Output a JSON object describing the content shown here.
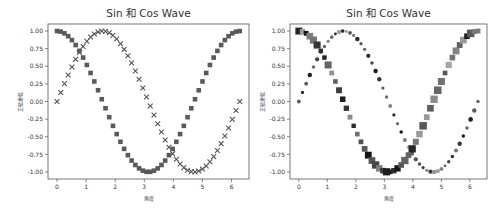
{
  "chart_data": [
    {
      "type": "scatter",
      "title": "Sin 和 Cos Wave",
      "xlabel": "角度",
      "ylabel": "正弦余弦",
      "xlim": [
        -0.31,
        6.6
      ],
      "ylim": [
        -1.1,
        1.1
      ],
      "xticks": [
        0,
        1,
        2,
        3,
        4,
        5,
        6
      ],
      "yticks": [
        -1.0,
        -0.75,
        -0.5,
        -0.25,
        0.0,
        0.25,
        0.5,
        0.75,
        1.0
      ],
      "ytick_labels": [
        "-1.00",
        "-0.75",
        "-0.50",
        "-0.25",
        "0.00",
        "0.25",
        "0.50",
        "0.75",
        "1.00"
      ],
      "grid": false,
      "legend": null,
      "x_range": [
        0,
        6.283
      ],
      "n_points": 50,
      "series": [
        {
          "name": "sin",
          "function": "sin(x)",
          "marker": "x",
          "color": "#555555",
          "size": "uniform"
        },
        {
          "name": "cos",
          "function": "cos(x)",
          "marker": "s",
          "color": "#555555",
          "size": "uniform"
        }
      ]
    },
    {
      "type": "scatter",
      "title": "Sin 和 Cos Wave",
      "xlabel": "角度",
      "ylabel": "正弦余弦",
      "xlim": [
        -0.31,
        6.6
      ],
      "ylim": [
        -1.1,
        1.1
      ],
      "xticks": [
        0,
        1,
        2,
        3,
        4,
        5,
        6
      ],
      "yticks": [
        -1.0,
        -0.75,
        -0.5,
        -0.25,
        0.0,
        0.25,
        0.5,
        0.75,
        1.0
      ],
      "ytick_labels": [
        "-1.00",
        "-0.75",
        "-0.50",
        "-0.25",
        "0.00",
        "0.25",
        "0.50",
        "0.75",
        "1.00"
      ],
      "grid": false,
      "legend": null,
      "x_range": [
        0,
        6.283
      ],
      "n_points": 50,
      "series": [
        {
          "name": "sin",
          "function": "sin(x)",
          "marker": "o",
          "color": "varied gray",
          "size": "small, varied shade"
        },
        {
          "name": "cos",
          "function": "cos(x)",
          "marker": "s",
          "color": "varied gray",
          "size": "varied size and shade"
        }
      ]
    }
  ],
  "charts": [
    {
      "title": "Sin 和 Cos Wave",
      "xlabel": "角度",
      "ylabel": "正弦余弦"
    },
    {
      "title": "Sin 和 Cos Wave",
      "xlabel": "角度",
      "ylabel": "正弦余弦"
    }
  ]
}
